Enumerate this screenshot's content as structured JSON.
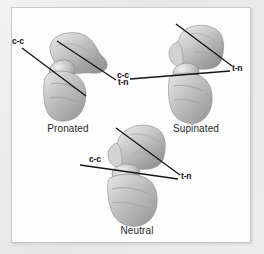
{
  "figure": {
    "panel_background": "#fdfdfd",
    "panel_border_color": "#c9c9c9",
    "page_background": "#ededed",
    "line_color": "#141414",
    "bone_light": "#e2e2e2",
    "bone_mid": "#b8b8b8",
    "bone_dark": "#8f8f8f"
  },
  "specimens": [
    {
      "id": "pronated",
      "caption": "Pronated",
      "labels": {
        "cc": "c-c",
        "tn": "t-n"
      }
    },
    {
      "id": "supinated",
      "caption": "Supinated",
      "labels": {
        "cc": "c-c",
        "tn": "t-n"
      }
    },
    {
      "id": "neutral",
      "caption": "Neutral",
      "labels": {
        "cc": "c-c",
        "tn": "t-n"
      }
    }
  ]
}
